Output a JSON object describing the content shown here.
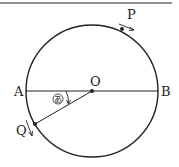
{
  "diagram": {
    "type": "circle-geometry",
    "points": {
      "A": {
        "label": "A"
      },
      "B": {
        "label": "B"
      },
      "O": {
        "label": "O"
      },
      "P": {
        "label": "P"
      },
      "Q": {
        "label": "Q"
      }
    },
    "angle_marker": {
      "label": "あ"
    },
    "colors": {
      "stroke": "#222222",
      "background": "#ffffff"
    }
  }
}
